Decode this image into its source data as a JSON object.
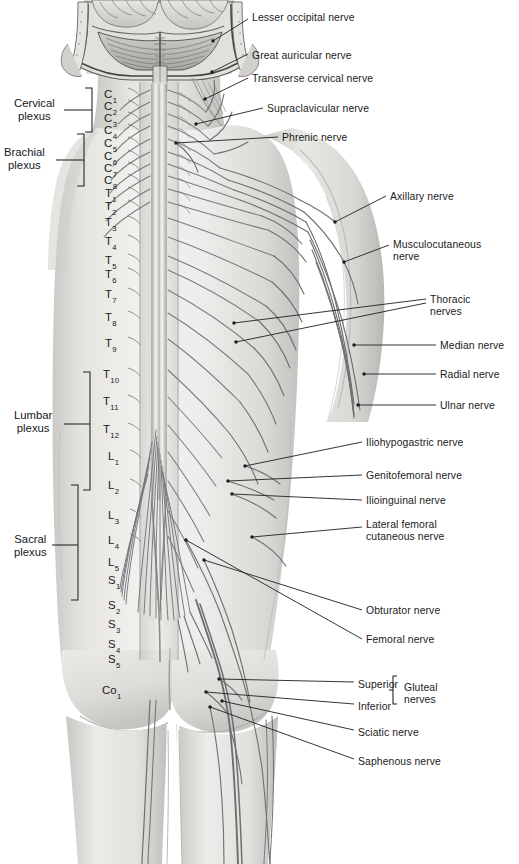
{
  "figure": {
    "ink": "#1b1b1b",
    "skin_light": "#f2f1ef",
    "skin_mid": "#dcdad6",
    "skin_shadow": "#bdbbb7",
    "nerve_line": "#6f6f72",
    "leader_line": "#2a2a2a"
  },
  "right_labels": [
    {
      "id": "lesser-occipital",
      "text": "Lesser occipital nerve",
      "x": 252,
      "y": 12
    },
    {
      "id": "great-auricular",
      "text": "Great auricular nerve",
      "x": 252,
      "y": 50
    },
    {
      "id": "transverse-cervical",
      "text": "Transverse cervical nerve",
      "x": 252,
      "y": 73
    },
    {
      "id": "supraclavicular",
      "text": "Supraclavicular nerve",
      "x": 267,
      "y": 103
    },
    {
      "id": "phrenic",
      "text": "Phrenic nerve",
      "x": 282,
      "y": 132
    },
    {
      "id": "axillary",
      "text": "Axillary nerve",
      "x": 390,
      "y": 191
    },
    {
      "id": "musculocutaneous",
      "text": "Musculocutaneous\nnerve",
      "x": 393,
      "y": 239
    },
    {
      "id": "thoracic",
      "text": "Thoracic\nnerves",
      "x": 430,
      "y": 294
    },
    {
      "id": "median",
      "text": "Median nerve",
      "x": 440,
      "y": 340
    },
    {
      "id": "radial",
      "text": "Radial nerve",
      "x": 440,
      "y": 369
    },
    {
      "id": "ulnar",
      "text": "Ulnar nerve",
      "x": 440,
      "y": 400
    },
    {
      "id": "iliohypogastric",
      "text": "Iliohypogastric nerve",
      "x": 366,
      "y": 437
    },
    {
      "id": "genitofemoral",
      "text": "Genitofemoral nerve",
      "x": 366,
      "y": 470
    },
    {
      "id": "ilioinguinal",
      "text": "Ilioinguinal nerve",
      "x": 366,
      "y": 495
    },
    {
      "id": "lateral-femoral-cutaneous",
      "text": "Lateral femoral\ncutaneous nerve",
      "x": 366,
      "y": 519
    },
    {
      "id": "obturator",
      "text": "Obturator nerve",
      "x": 366,
      "y": 605
    },
    {
      "id": "femoral",
      "text": "Femoral nerve",
      "x": 366,
      "y": 634
    },
    {
      "id": "sciatic",
      "text": "Sciatic nerve",
      "x": 358,
      "y": 727
    },
    {
      "id": "saphenous",
      "text": "Saphenous nerve",
      "x": 358,
      "y": 756
    }
  ],
  "gluteal_group": {
    "superior": "Superior",
    "inferior": "Inferior",
    "group_label": "Gluteal\nnerves",
    "superior_x": 358,
    "superior_y": 679,
    "inferior_x": 358,
    "inferior_y": 701,
    "group_x": 404,
    "group_y": 682
  },
  "plexuses": [
    {
      "id": "cervical",
      "text": "Cervical\nplexus",
      "x": 14,
      "y": 97,
      "bracket_top": 88,
      "bracket_bottom": 132,
      "bracket_x": 92,
      "tick_y": 110,
      "tick_x1": 64,
      "tick_x2": 92
    },
    {
      "id": "brachial",
      "text": "Brachial\nplexus",
      "x": 4,
      "y": 146,
      "bracket_top": 134,
      "bracket_bottom": 186,
      "bracket_x": 84,
      "tick_y": 160,
      "tick_x1": 56,
      "tick_x2": 84
    },
    {
      "id": "lumbar",
      "text": "Lumbar\nplexus",
      "x": 14,
      "y": 409,
      "bracket_top": 372,
      "bracket_bottom": 490,
      "bracket_x": 90,
      "tick_y": 424,
      "tick_x1": 64,
      "tick_x2": 90
    },
    {
      "id": "sacral",
      "text": "Sacral\nplexus",
      "x": 14,
      "y": 533,
      "bracket_top": 485,
      "bracket_bottom": 600,
      "bracket_x": 78,
      "tick_y": 545,
      "tick_x1": 52,
      "tick_x2": 78
    }
  ],
  "vertebrae": [
    {
      "label": "C",
      "sub": "1",
      "x": 104,
      "y": 88
    },
    {
      "label": "C",
      "sub": "2",
      "x": 104,
      "y": 100
    },
    {
      "label": "C",
      "sub": "3",
      "x": 104,
      "y": 112
    },
    {
      "label": "C",
      "sub": "4",
      "x": 104,
      "y": 124
    },
    {
      "label": "C",
      "sub": "5",
      "x": 104,
      "y": 137
    },
    {
      "label": "C",
      "sub": "6",
      "x": 104,
      "y": 150
    },
    {
      "label": "C",
      "sub": "7",
      "x": 104,
      "y": 162
    },
    {
      "label": "C",
      "sub": "8",
      "x": 104,
      "y": 174
    },
    {
      "label": "T",
      "sub": "1",
      "x": 105,
      "y": 187
    },
    {
      "label": "T",
      "sub": "2",
      "x": 105,
      "y": 200
    },
    {
      "label": "T",
      "sub": "3",
      "x": 105,
      "y": 216
    },
    {
      "label": "T",
      "sub": "4",
      "x": 105,
      "y": 235
    },
    {
      "label": "T",
      "sub": "5",
      "x": 105,
      "y": 254
    },
    {
      "label": "T",
      "sub": "6",
      "x": 105,
      "y": 268
    },
    {
      "label": "T",
      "sub": "7",
      "x": 105,
      "y": 288
    },
    {
      "label": "T",
      "sub": "8",
      "x": 105,
      "y": 311
    },
    {
      "label": "T",
      "sub": "9",
      "x": 105,
      "y": 337
    },
    {
      "label": "T",
      "sub": "10",
      "x": 103,
      "y": 368
    },
    {
      "label": "T",
      "sub": "11",
      "x": 103,
      "y": 395
    },
    {
      "label": "T",
      "sub": "12",
      "x": 103,
      "y": 423
    },
    {
      "label": "L",
      "sub": "1",
      "x": 108,
      "y": 450
    },
    {
      "label": "L",
      "sub": "2",
      "x": 108,
      "y": 479
    },
    {
      "label": "L",
      "sub": "3",
      "x": 108,
      "y": 509
    },
    {
      "label": "L",
      "sub": "4",
      "x": 108,
      "y": 534
    },
    {
      "label": "L",
      "sub": "5",
      "x": 108,
      "y": 556
    },
    {
      "label": "S",
      "sub": "1",
      "x": 108,
      "y": 574
    },
    {
      "label": "S",
      "sub": "2",
      "x": 108,
      "y": 599
    },
    {
      "label": "S",
      "sub": "3",
      "x": 108,
      "y": 618
    },
    {
      "label": "S",
      "sub": "4",
      "x": 108,
      "y": 638
    },
    {
      "label": "S",
      "sub": "5",
      "x": 108,
      "y": 653
    },
    {
      "label": "Co",
      "sub": "1",
      "x": 102,
      "y": 684
    }
  ],
  "leaders": [
    {
      "id": "lesser-occipital-leader",
      "d": "M248,19 L213,41"
    },
    {
      "id": "great-auricular-leader",
      "d": "M248,54 L212,72"
    },
    {
      "id": "transverse-cervical-leader",
      "d": "M248,78 L205,99"
    },
    {
      "id": "supraclavicular-leader",
      "d": "M263,108 L196,124"
    },
    {
      "id": "phrenic-leader",
      "d": "M278,137 L176,143"
    },
    {
      "id": "axillary-leader",
      "d": "M386,196 L335,222"
    },
    {
      "id": "musculocutaneous-leader",
      "d": "M389,245 L344,262"
    },
    {
      "id": "thoracic-leader-a",
      "d": "M426,299 L234,323"
    },
    {
      "id": "thoracic-leader-b",
      "d": "M426,303 L236,342"
    },
    {
      "id": "median-leader",
      "d": "M436,345 L354,345"
    },
    {
      "id": "radial-leader",
      "d": "M436,374 L364,374"
    },
    {
      "id": "ulnar-leader",
      "d": "M436,405 L358,405"
    },
    {
      "id": "iliohypogastric-leader",
      "d": "M362,442 L245,466"
    },
    {
      "id": "genitofemoral-leader",
      "d": "M362,475 L228,481"
    },
    {
      "id": "ilioinguinal-leader",
      "d": "M362,500 L232,494"
    },
    {
      "id": "lateral-femoral-leader",
      "d": "M362,527 L252,537"
    },
    {
      "id": "obturator-leader",
      "d": "M362,610 L204,560"
    },
    {
      "id": "femoral-leader",
      "d": "M362,639 L186,540"
    },
    {
      "id": "superior-gluteal-leader",
      "d": "M354,682 L219,679"
    },
    {
      "id": "inferior-gluteal-leader",
      "d": "M354,704 L206,692"
    },
    {
      "id": "sciatic-leader",
      "d": "M354,730 L222,701"
    },
    {
      "id": "saphenous-leader",
      "d": "M354,759 L210,707"
    }
  ]
}
